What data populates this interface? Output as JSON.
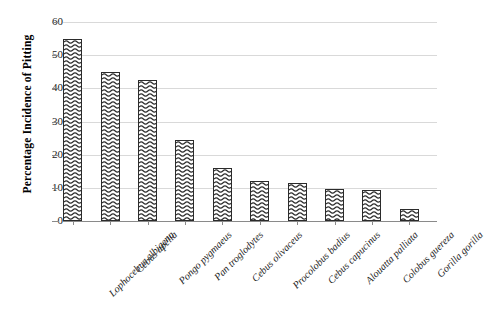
{
  "chart_data": {
    "type": "bar",
    "title": "",
    "xlabel": "",
    "ylabel": "Percentage Incidence of Pitting",
    "ylim": [
      0,
      60
    ],
    "ytick_values": [
      0,
      10,
      20,
      30,
      40,
      50,
      60
    ],
    "ytick_labels": [
      "0",
      "10",
      "20",
      "30",
      "40",
      "50",
      "60"
    ],
    "grid": true,
    "legend": false,
    "categories": [
      "Lophocebus albigena",
      "Cebus apella",
      "Pongo pygmaeus",
      "Pan troglodytes",
      "Cebus olivaceus",
      "Procolobus badius",
      "Cebus capucinus",
      "Alouatta palliata",
      "Colobus guereza",
      "Gorilla gorilla"
    ],
    "values": [
      55,
      45,
      42.5,
      24.5,
      16,
      12,
      11.5,
      9.7,
      9.5,
      3.5
    ]
  }
}
